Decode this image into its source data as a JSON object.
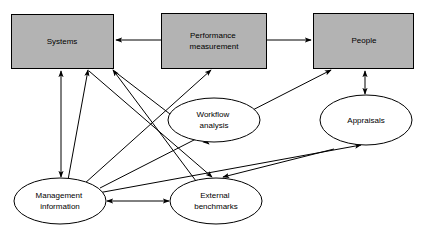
{
  "diagram": {
    "type": "relationship-diagram",
    "background_color": "#ffffff",
    "box_fill_color": "#b3b3b3",
    "ellipse_fill_color": "#ffffff",
    "stroke_color": "#000000",
    "nodes": [
      {
        "id": "systems",
        "shape": "rectangle",
        "label": "Systems",
        "lines": [
          "Systems"
        ],
        "x": 11,
        "y": 14,
        "width": 102,
        "height": 54
      },
      {
        "id": "performance-measurement",
        "shape": "rectangle",
        "label": "Performance measurement",
        "lines": [
          "Performance",
          "measurement"
        ],
        "x": 161,
        "y": 13,
        "width": 105,
        "height": 55
      },
      {
        "id": "people",
        "shape": "rectangle",
        "label": "People",
        "lines": [
          "People"
        ],
        "x": 313,
        "y": 13,
        "width": 100,
        "height": 55
      },
      {
        "id": "workflow-analysis",
        "shape": "ellipse",
        "label": "Workflow analysis",
        "lines": [
          "Workflow",
          "analysis"
        ],
        "cx": 214,
        "cy": 120,
        "rx": 46,
        "ry": 22
      },
      {
        "id": "appraisals",
        "shape": "ellipse",
        "label": "Appraisals",
        "lines": [
          "Appraisals"
        ],
        "cx": 366,
        "cy": 120,
        "rx": 46,
        "ry": 25
      },
      {
        "id": "management-information",
        "shape": "ellipse",
        "label": "Management information",
        "lines": [
          "Management",
          "information"
        ],
        "cx": 60,
        "cy": 201,
        "rx": 46,
        "ry": 23
      },
      {
        "id": "external-benchmarks",
        "shape": "ellipse",
        "label": "External benchmarks",
        "lines": [
          "External",
          "benchmarks"
        ],
        "cx": 216,
        "cy": 201,
        "rx": 46,
        "ry": 23
      }
    ],
    "edges": [
      {
        "id": "performance-to-systems",
        "from": "performance-measurement",
        "to": "systems",
        "arrow": "single",
        "x1": 161,
        "y1": 40,
        "x2": 115,
        "y2": 40
      },
      {
        "id": "performance-to-people",
        "from": "performance-measurement",
        "to": "people",
        "arrow": "single",
        "x1": 266,
        "y1": 40,
        "x2": 311,
        "y2": 40
      },
      {
        "id": "systems-management-information",
        "from": "systems",
        "to": "management-information",
        "arrow": "double",
        "x1": 61,
        "y1": 70,
        "x2": 61,
        "y2": 177
      },
      {
        "id": "management-information-to-systems",
        "from": "management-information",
        "to": "systems",
        "arrow": "single",
        "x1": 67,
        "y1": 179,
        "x2": 88,
        "y2": 70
      },
      {
        "id": "external-benchmarks-to-systems",
        "from": "external-benchmarks",
        "to": "systems",
        "arrow": "single",
        "x1": 196,
        "y1": 180,
        "x2": 113,
        "y2": 70
      },
      {
        "id": "management-information-to-performance",
        "from": "management-information",
        "to": "performance-measurement",
        "arrow": "single",
        "x1": 85,
        "y1": 185,
        "x2": 211,
        "y2": 70
      },
      {
        "id": "management-information-to-people",
        "from": "management-information",
        "to": "people",
        "arrow": "single",
        "x1": 100,
        "y1": 188,
        "x2": 331,
        "y2": 70
      },
      {
        "id": "management-information-to-appraisals",
        "from": "management-information",
        "to": "appraisals",
        "arrow": "single",
        "x1": 100,
        "y1": 192,
        "x2": 360,
        "y2": 144
      },
      {
        "id": "systems-to-workflow-analysis",
        "from": "systems",
        "to": "workflow-analysis",
        "arrow": "single",
        "x1": 114,
        "y1": 71,
        "x2": 209,
        "y2": 144
      },
      {
        "id": "systems-to-external-benchmarks",
        "from": "systems",
        "to": "external-benchmarks",
        "arrow": "single",
        "x1": 90,
        "y1": 71,
        "x2": 213,
        "y2": 177
      },
      {
        "id": "workflow-analysis-to-external-benchmarks",
        "from": "workflow-analysis",
        "to": "external-benchmarks",
        "arrow": "single",
        "x1": 330,
        "y1": 148,
        "x2": 222,
        "y2": 177
      },
      {
        "id": "people-appraisals",
        "from": "people",
        "to": "appraisals",
        "arrow": "double",
        "x1": 365,
        "y1": 70,
        "x2": 365,
        "y2": 93
      },
      {
        "id": "management-information-external-benchmarks",
        "from": "management-information",
        "to": "external-benchmarks",
        "arrow": "double",
        "x1": 107,
        "y1": 201,
        "x2": 169,
        "y2": 201
      }
    ]
  }
}
